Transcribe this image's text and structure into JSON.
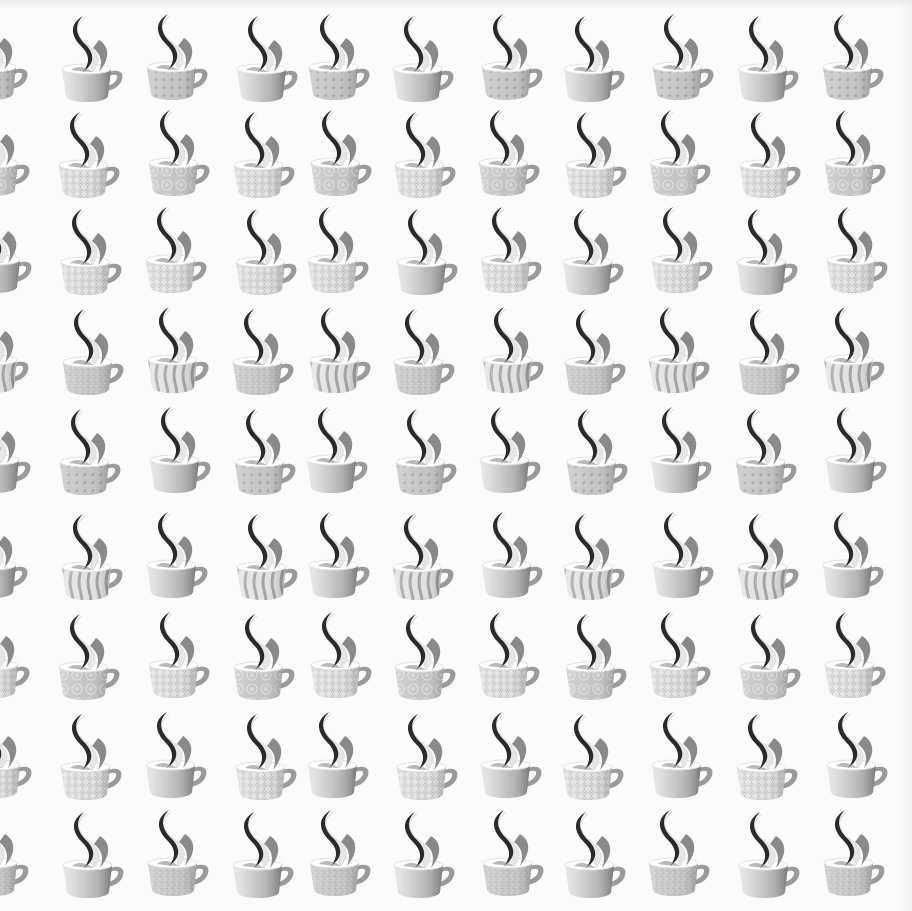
{
  "image": {
    "description": "Repeating print of grayscale steaming coffee cups with assorted surface patterns on white",
    "background": "#fbfbfb",
    "cup_colors": {
      "steam_dark": "#2a2a2a",
      "steam_mid": "#8a8a8a",
      "steam_light": "#e6e6e6",
      "body_base": "#c4c4c4",
      "body_light": "#e2e2e2",
      "body_shadow": "#9a9a9a",
      "rim_inner": "#ffffff",
      "pattern_mark": "#8f8f8f"
    },
    "row_tops": [
      12,
      108,
      205,
      305,
      405,
      510,
      610,
      710,
      808
    ],
    "col_lefts": [
      -34,
      58,
      145,
      232,
      306,
      392,
      478,
      562,
      648,
      735,
      822
    ],
    "pattern_types": [
      "plain",
      "dots",
      "diamond",
      "medallion",
      "speckle",
      "zebra"
    ],
    "grid": [
      [
        "dots",
        "plain",
        "dots",
        "plain",
        "dots",
        "plain",
        "dots",
        "plain",
        "dots",
        "plain",
        "dots"
      ],
      [
        "medallion",
        "diamond",
        "medallion",
        "diamond",
        "medallion",
        "diamond",
        "medallion",
        "diamond",
        "medallion",
        "diamond",
        "medallion"
      ],
      [
        "plain",
        "diamond",
        "diamond",
        "diamond",
        "diamond",
        "plain",
        "diamond",
        "plain",
        "diamond",
        "plain",
        "diamond"
      ],
      [
        "zebra",
        "speckle",
        "zebra",
        "speckle",
        "zebra",
        "speckle",
        "zebra",
        "speckle",
        "zebra",
        "speckle",
        "zebra"
      ],
      [
        "plain",
        "dots",
        "plain",
        "dots",
        "plain",
        "dots",
        "plain",
        "dots",
        "plain",
        "dots",
        "plain"
      ],
      [
        "plain",
        "zebra",
        "plain",
        "zebra",
        "plain",
        "zebra",
        "plain",
        "zebra",
        "plain",
        "zebra",
        "plain"
      ],
      [
        "diamond",
        "medallion",
        "diamond",
        "medallion",
        "diamond",
        "medallion",
        "diamond",
        "medallion",
        "diamond",
        "medallion",
        "diamond"
      ],
      [
        "diamond",
        "diamond",
        "plain",
        "diamond",
        "plain",
        "diamond",
        "plain",
        "diamond",
        "plain",
        "diamond",
        "plain"
      ],
      [
        "speckle",
        "plain",
        "speckle",
        "plain",
        "speckle",
        "plain",
        "speckle",
        "plain",
        "speckle",
        "plain",
        "speckle"
      ]
    ]
  }
}
